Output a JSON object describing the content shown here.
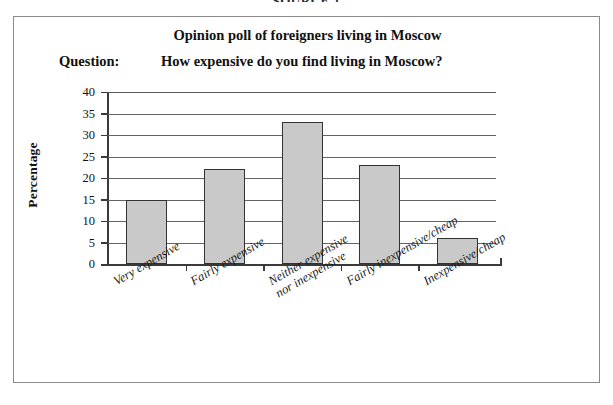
{
  "source_header": "SOURCE 1",
  "frame": {
    "title": "Opinion poll of foreigners living in Moscow",
    "question_label": "Question:",
    "question_text": "How expensive do you find living in Moscow?"
  },
  "colors": {
    "bar_fill": "#c9c9c9",
    "bar_border": "#333333",
    "gridline": "#646464",
    "axis": "#3a3a3a",
    "frame_border": "#8a8a8a",
    "text": "#111111"
  },
  "chart_data": {
    "type": "bar",
    "title": "Opinion poll of foreigners living in Moscow",
    "subtitle": "Question: How expensive do you find living in Moscow?",
    "xlabel": "",
    "ylabel": "Percentage",
    "ylim": [
      0,
      40
    ],
    "ytick_step": 5,
    "yticks": [
      40,
      35,
      30,
      25,
      20,
      15,
      10,
      5,
      0
    ],
    "grid": true,
    "legend": false,
    "categories": [
      "Very expensive",
      "Fairly expensive",
      "Neither expensive nor inexpensive",
      "Fairly inexpensive/cheap",
      "Inexpensive/cheap"
    ],
    "category_lines": [
      [
        "Very expensive"
      ],
      [
        "Fairly expensive"
      ],
      [
        "Neither expensive",
        "nor inexpensive"
      ],
      [
        "Fairly inexpensive/cheap"
      ],
      [
        "Inexpensive/cheap"
      ]
    ],
    "values": [
      15,
      22,
      33,
      23,
      6
    ],
    "units": "percent"
  }
}
